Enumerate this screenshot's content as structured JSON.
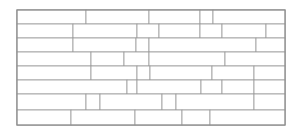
{
  "figure": {
    "kind": "brick-tiling-diagram",
    "title": "",
    "canvas": {
      "width": 297,
      "height": 137
    },
    "background_color": "#ffffff"
  },
  "panel": {
    "x": 17,
    "y": 10,
    "width": 268,
    "height": 115,
    "fill": "#ffffff",
    "stroke": "#8c8c8c",
    "stroke_width": 1
  },
  "style": {
    "brick_fill": "#ffffff",
    "brick_stroke": "#9a9a9a",
    "brick_stroke_width": 0.8
  },
  "layout": {
    "course_count": 8,
    "course_boundaries_y": [
      10,
      24,
      38,
      52,
      66,
      80,
      94,
      110,
      125
    ],
    "pattern": "running-bond-with-offset-jogs"
  },
  "bricks": [
    {
      "id": "b01",
      "x": 17,
      "y": 10,
      "w": 69,
      "h": 14
    },
    {
      "id": "b02",
      "x": 86,
      "y": 10,
      "w": 63,
      "h": 14
    },
    {
      "id": "b03",
      "x": 149,
      "y": 10,
      "w": 51,
      "h": 14
    },
    {
      "id": "b04",
      "x": 200,
      "y": 10,
      "w": 13,
      "h": 14
    },
    {
      "id": "b05",
      "x": 213,
      "y": 10,
      "w": 72,
      "h": 14
    },
    {
      "id": "b06",
      "x": 17,
      "y": 24,
      "w": 56,
      "h": 14
    },
    {
      "id": "b07",
      "x": 73,
      "y": 24,
      "w": 64,
      "h": 14
    },
    {
      "id": "b08",
      "x": 137,
      "y": 24,
      "w": 22,
      "h": 14
    },
    {
      "id": "b09",
      "x": 159,
      "y": 24,
      "w": 41,
      "h": 14
    },
    {
      "id": "b10",
      "x": 200,
      "y": 24,
      "w": 22,
      "h": 14
    },
    {
      "id": "b11",
      "x": 222,
      "y": 24,
      "w": 44,
      "h": 14
    },
    {
      "id": "b12",
      "x": 266,
      "y": 24,
      "w": 19,
      "h": 14
    },
    {
      "id": "b13",
      "x": 17,
      "y": 38,
      "w": 56,
      "h": 14
    },
    {
      "id": "b14",
      "x": 73,
      "y": 38,
      "w": 63,
      "h": 14
    },
    {
      "id": "b15",
      "x": 136,
      "y": 38,
      "w": 13,
      "h": 14
    },
    {
      "id": "b16",
      "x": 149,
      "y": 38,
      "w": 107,
      "h": 14
    },
    {
      "id": "b17",
      "x": 256,
      "y": 38,
      "w": 29,
      "h": 14
    },
    {
      "id": "b18",
      "x": 17,
      "y": 52,
      "w": 74,
      "h": 14
    },
    {
      "id": "b19",
      "x": 91,
      "y": 52,
      "w": 33,
      "h": 14
    },
    {
      "id": "b20",
      "x": 124,
      "y": 52,
      "w": 25,
      "h": 14
    },
    {
      "id": "b21",
      "x": 149,
      "y": 52,
      "w": 76,
      "h": 14
    },
    {
      "id": "b22",
      "x": 225,
      "y": 52,
      "w": 60,
      "h": 14
    },
    {
      "id": "b23",
      "x": 17,
      "y": 66,
      "w": 74,
      "h": 14
    },
    {
      "id": "b24",
      "x": 91,
      "y": 66,
      "w": 46,
      "h": 14
    },
    {
      "id": "b25",
      "x": 137,
      "y": 66,
      "w": 13,
      "h": 14
    },
    {
      "id": "b26",
      "x": 150,
      "y": 66,
      "w": 62,
      "h": 14
    },
    {
      "id": "b27",
      "x": 212,
      "y": 66,
      "w": 42,
      "h": 14
    },
    {
      "id": "b28",
      "x": 254,
      "y": 66,
      "w": 31,
      "h": 14
    },
    {
      "id": "b29",
      "x": 17,
      "y": 80,
      "w": 110,
      "h": 14
    },
    {
      "id": "b30",
      "x": 127,
      "y": 80,
      "w": 10,
      "h": 14
    },
    {
      "id": "b31",
      "x": 137,
      "y": 80,
      "w": 64,
      "h": 14
    },
    {
      "id": "b32",
      "x": 201,
      "y": 80,
      "w": 21,
      "h": 14
    },
    {
      "id": "b33",
      "x": 222,
      "y": 80,
      "w": 32,
      "h": 14
    },
    {
      "id": "b34",
      "x": 254,
      "y": 80,
      "w": 31,
      "h": 14
    },
    {
      "id": "b35",
      "x": 17,
      "y": 94,
      "w": 69,
      "h": 16
    },
    {
      "id": "b36",
      "x": 86,
      "y": 94,
      "w": 14,
      "h": 16
    },
    {
      "id": "b37",
      "x": 100,
      "y": 94,
      "w": 62,
      "h": 16
    },
    {
      "id": "b38",
      "x": 162,
      "y": 94,
      "w": 14,
      "h": 16
    },
    {
      "id": "b39",
      "x": 176,
      "y": 94,
      "w": 78,
      "h": 16
    },
    {
      "id": "b40",
      "x": 254,
      "y": 94,
      "w": 31,
      "h": 16
    },
    {
      "id": "b41",
      "x": 17,
      "y": 110,
      "w": 54,
      "h": 15
    },
    {
      "id": "b42",
      "x": 71,
      "y": 110,
      "w": 64,
      "h": 15
    },
    {
      "id": "b43",
      "x": 135,
      "y": 110,
      "w": 47,
      "h": 15
    },
    {
      "id": "b44",
      "x": 182,
      "y": 110,
      "w": 28,
      "h": 15
    },
    {
      "id": "b45",
      "x": 210,
      "y": 110,
      "w": 75,
      "h": 15
    }
  ],
  "joints": [
    {
      "id": "j01",
      "x1": 17,
      "y1": 24,
      "x2": 285,
      "y2": 24
    },
    {
      "id": "j02",
      "x1": 17,
      "y1": 38,
      "x2": 285,
      "y2": 38
    },
    {
      "id": "j03",
      "x1": 17,
      "y1": 52,
      "x2": 285,
      "y2": 52
    },
    {
      "id": "j04",
      "x1": 17,
      "y1": 66,
      "x2": 285,
      "y2": 66
    },
    {
      "id": "j05",
      "x1": 17,
      "y1": 80,
      "x2": 285,
      "y2": 80
    },
    {
      "id": "j06",
      "x1": 17,
      "y1": 94,
      "x2": 285,
      "y2": 94
    },
    {
      "id": "j07",
      "x1": 17,
      "y1": 110,
      "x2": 285,
      "y2": 110
    }
  ],
  "offset_jogs": [
    {
      "id": "g01",
      "x": 200,
      "y": 10,
      "w": 13,
      "h": 14,
      "note": "notch at top course near x=200"
    },
    {
      "id": "g02",
      "x": 136,
      "y": 38,
      "w": 13,
      "h": 14,
      "note": "short stub left of long brick"
    },
    {
      "id": "g03",
      "x": 127,
      "y": 80,
      "w": 10,
      "h": 14,
      "note": "narrow jog brick"
    },
    {
      "id": "g04",
      "x": 86,
      "y": 94,
      "w": 14,
      "h": 16,
      "note": "half-brick jog"
    },
    {
      "id": "g05",
      "x": 162,
      "y": 94,
      "w": 14,
      "h": 16,
      "note": "half-brick jog"
    }
  ]
}
